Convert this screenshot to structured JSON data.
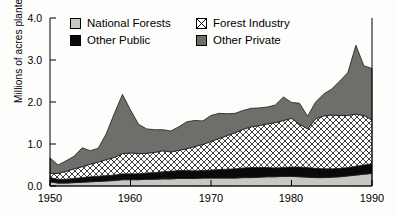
{
  "chart_data": {
    "type": "area",
    "stacked": true,
    "title": "",
    "xlabel": "",
    "ylabel": "Millions of acres planted",
    "xlim": [
      1950,
      1990
    ],
    "ylim": [
      0.0,
      4.0
    ],
    "xticks": [
      "1950",
      "1960",
      "1970",
      "1980",
      "1990"
    ],
    "xtick_values": [
      1950,
      1960,
      1970,
      1980,
      1990
    ],
    "yticks": [
      "0.0",
      "1.0",
      "2.0",
      "3.0",
      "4.0"
    ],
    "ytick_values": [
      0.0,
      1.0,
      2.0,
      3.0,
      4.0
    ],
    "grid": false,
    "legend_position": "top-inside",
    "x": [
      1950,
      1951,
      1952,
      1953,
      1954,
      1955,
      1956,
      1957,
      1958,
      1959,
      1960,
      1961,
      1962,
      1963,
      1964,
      1965,
      1966,
      1967,
      1968,
      1969,
      1970,
      1971,
      1972,
      1973,
      1974,
      1975,
      1976,
      1977,
      1978,
      1979,
      1980,
      1981,
      1982,
      1983,
      1984,
      1985,
      1986,
      1987,
      1988,
      1989,
      1990
    ],
    "series": [
      {
        "name": "National Forests",
        "color": "#c7c7c4",
        "pattern": "solid",
        "values": [
          0.1,
          0.07,
          0.07,
          0.08,
          0.09,
          0.1,
          0.11,
          0.12,
          0.13,
          0.15,
          0.15,
          0.15,
          0.16,
          0.16,
          0.17,
          0.17,
          0.18,
          0.18,
          0.18,
          0.19,
          0.19,
          0.19,
          0.19,
          0.19,
          0.2,
          0.2,
          0.21,
          0.22,
          0.22,
          0.23,
          0.23,
          0.22,
          0.21,
          0.2,
          0.2,
          0.21,
          0.22,
          0.24,
          0.26,
          0.28,
          0.3
        ]
      },
      {
        "name": "Other Public",
        "color": "#0a0a0a",
        "pattern": "solid",
        "values": [
          0.1,
          0.09,
          0.09,
          0.1,
          0.11,
          0.12,
          0.12,
          0.13,
          0.13,
          0.14,
          0.14,
          0.14,
          0.15,
          0.16,
          0.17,
          0.18,
          0.19,
          0.19,
          0.18,
          0.18,
          0.19,
          0.2,
          0.21,
          0.22,
          0.23,
          0.24,
          0.23,
          0.22,
          0.21,
          0.21,
          0.22,
          0.23,
          0.23,
          0.22,
          0.21,
          0.2,
          0.2,
          0.2,
          0.21,
          0.22,
          0.23
        ]
      },
      {
        "name": "Forest Industry",
        "color": "#ffffff",
        "pattern": "crosshatch",
        "values": [
          0.1,
          0.14,
          0.19,
          0.23,
          0.26,
          0.3,
          0.34,
          0.38,
          0.42,
          0.48,
          0.5,
          0.48,
          0.47,
          0.48,
          0.5,
          0.46,
          0.48,
          0.52,
          0.58,
          0.62,
          0.68,
          0.74,
          0.8,
          0.86,
          0.92,
          0.97,
          1.0,
          1.04,
          1.08,
          1.12,
          1.16,
          1.02,
          0.92,
          1.18,
          1.26,
          1.28,
          1.26,
          1.24,
          1.24,
          1.18,
          1.04
        ]
      },
      {
        "name": "Other Private",
        "color": "#6e6e6b",
        "pattern": "solid",
        "values": [
          0.37,
          0.2,
          0.25,
          0.3,
          0.45,
          0.32,
          0.33,
          0.62,
          1.05,
          1.41,
          1.02,
          0.7,
          0.58,
          0.54,
          0.5,
          0.5,
          0.56,
          0.64,
          0.62,
          0.56,
          0.62,
          0.6,
          0.52,
          0.46,
          0.45,
          0.44,
          0.42,
          0.4,
          0.42,
          0.56,
          0.38,
          0.5,
          0.3,
          0.4,
          0.52,
          0.62,
          0.82,
          1.02,
          1.64,
          1.18,
          1.23
        ]
      }
    ],
    "totals": [
      0.67,
      0.5,
      0.6,
      0.71,
      0.91,
      0.84,
      0.9,
      1.25,
      1.73,
      2.18,
      1.81,
      1.47,
      1.36,
      1.34,
      1.34,
      1.31,
      1.41,
      1.53,
      1.56,
      1.55,
      1.68,
      1.73,
      1.72,
      1.73,
      1.8,
      1.85,
      1.86,
      1.88,
      1.93,
      2.12,
      1.99,
      1.97,
      1.66,
      2.0,
      2.19,
      2.31,
      2.5,
      2.7,
      3.35,
      2.86,
      2.8
    ]
  },
  "legend": {
    "items": [
      {
        "label": "National Forests",
        "swatch": "swatch-national-forests"
      },
      {
        "label": "Other Public",
        "swatch": "swatch-other-public"
      },
      {
        "label": "Forest Industry",
        "swatch": "swatch-forest-industry"
      },
      {
        "label": "Other Private",
        "swatch": "swatch-other-private"
      }
    ]
  }
}
